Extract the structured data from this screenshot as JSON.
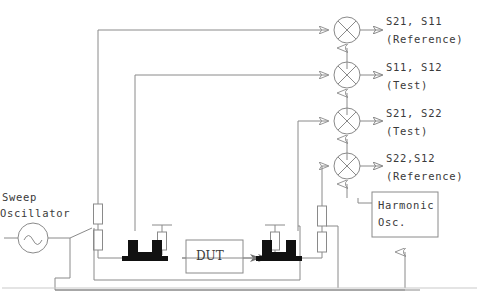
{
  "diagram": {
    "colors": {
      "line": "#8a8a8a",
      "ink": "#3a3a3a",
      "coupler": "#111111",
      "background": "#ffffff"
    },
    "source": {
      "label_line1": "Sweep",
      "label_line2": "Oscillator",
      "symbol": "sine-source-icon"
    },
    "dut": {
      "label": "DUT"
    },
    "harmonic_osc": {
      "label_line1": "Harmonic",
      "label_line2": "Osc."
    },
    "mixers": [
      {
        "id": "mixer-1",
        "label_line1": "S21, S11",
        "label_line2": "(Reference)",
        "cy": 30
      },
      {
        "id": "mixer-2",
        "label_line1": "S11, S12",
        "label_line2": "(Test)",
        "cy": 75
      },
      {
        "id": "mixer-3",
        "label_line1": "S21, S22",
        "label_line2": "(Test)",
        "cy": 121
      },
      {
        "id": "mixer-4",
        "label_line1": "S22,S12",
        "label_line2": "(Reference)",
        "cy": 166
      }
    ],
    "components": {
      "attenuator_count": 4,
      "coupler_count": 2,
      "coupler_left": "directional-coupler-left",
      "coupler_right": "directional-coupler-right"
    }
  }
}
